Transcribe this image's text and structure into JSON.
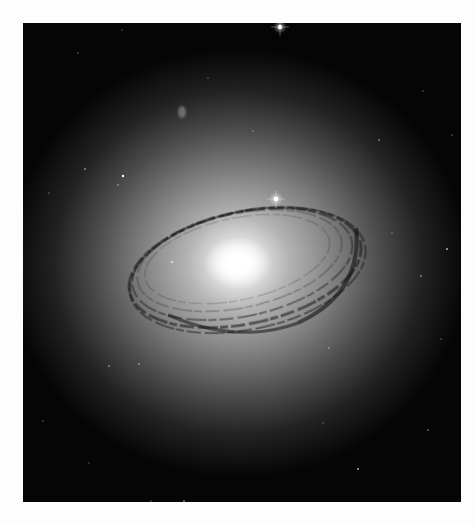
{
  "image": {
    "subject": "lenticular galaxy with dust ring",
    "alt": "Grayscale astronomical image of a bright elliptical galaxy core surrounded by a dark, tilted dust lane ring against a black starfield",
    "background_color": "#fdfdfd",
    "frame_color": "#050505"
  },
  "galaxy": {
    "core_center": [
      215,
      240
    ],
    "halo_rx": 230,
    "halo_ry": 215,
    "ring_rx": 118,
    "ring_ry": 56,
    "ring_rotation_deg": -12
  },
  "stars": [
    {
      "x": 257,
      "y": 4,
      "r": 2.2
    },
    {
      "x": 253,
      "y": 176,
      "r": 2.4
    },
    {
      "x": 100,
      "y": 153,
      "r": 1.2
    },
    {
      "x": 149,
      "y": 239,
      "r": 1.0
    },
    {
      "x": 62,
      "y": 146,
      "r": 0.8
    },
    {
      "x": 95,
      "y": 162,
      "r": 0.7
    },
    {
      "x": 356,
      "y": 117,
      "r": 0.8
    },
    {
      "x": 424,
      "y": 226,
      "r": 0.9
    },
    {
      "x": 398,
      "y": 253,
      "r": 0.8
    },
    {
      "x": 306,
      "y": 325,
      "r": 0.7
    },
    {
      "x": 86,
      "y": 343,
      "r": 0.8
    },
    {
      "x": 116,
      "y": 341,
      "r": 0.7
    },
    {
      "x": 26,
      "y": 170,
      "r": 0.6
    },
    {
      "x": 99,
      "y": 7,
      "r": 0.6
    },
    {
      "x": 55,
      "y": 30,
      "r": 0.6
    },
    {
      "x": 400,
      "y": 68,
      "r": 0.6
    },
    {
      "x": 429,
      "y": 112,
      "r": 0.6
    },
    {
      "x": 335,
      "y": 446,
      "r": 0.9
    },
    {
      "x": 405,
      "y": 407,
      "r": 0.7
    },
    {
      "x": 128,
      "y": 478,
      "r": 0.6
    },
    {
      "x": 161,
      "y": 478,
      "r": 0.8
    },
    {
      "x": 418,
      "y": 316,
      "r": 0.6
    },
    {
      "x": 230,
      "y": 108,
      "r": 0.6
    },
    {
      "x": 369,
      "y": 210,
      "r": 0.6
    },
    {
      "x": 20,
      "y": 398,
      "r": 0.6
    },
    {
      "x": 66,
      "y": 440,
      "r": 0.5
    },
    {
      "x": 300,
      "y": 400,
      "r": 0.5
    },
    {
      "x": 185,
      "y": 55,
      "r": 0.5
    }
  ],
  "companion_blob": {
    "x": 159,
    "y": 89,
    "rx": 4,
    "ry": 6
  }
}
